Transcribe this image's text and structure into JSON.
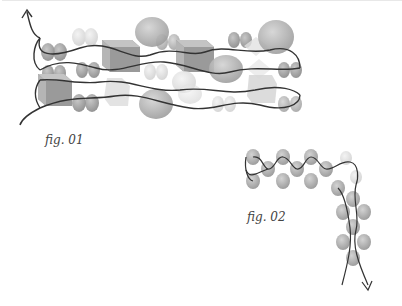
{
  "figures": [
    {
      "id": "fig1",
      "caption": "fig. 01"
    },
    {
      "id": "fig2",
      "caption": "fig. 02"
    }
  ],
  "colors": {
    "background": "#ffffff",
    "thread": "#333333",
    "bead_dark": "#8a8a8a",
    "bead_mid": "#a9a9a9",
    "bead_light": "#d6d6d6",
    "caption": "#444444"
  }
}
